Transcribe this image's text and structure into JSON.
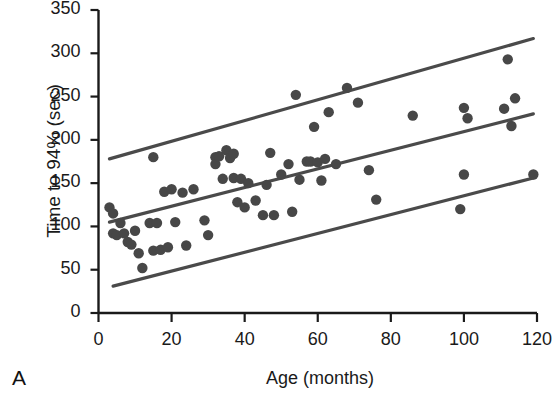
{
  "chart_data": {
    "type": "scatter",
    "title": "",
    "panel_label": "A",
    "xlabel": "Age (months)",
    "ylabel": "Time to 94% (sec)",
    "xlim": [
      0,
      120
    ],
    "ylim": [
      0,
      350
    ],
    "xticks": [
      0,
      20,
      40,
      60,
      80,
      100,
      120
    ],
    "yticks": [
      0,
      50,
      100,
      150,
      200,
      250,
      300,
      350
    ],
    "grid": false,
    "legend": "none",
    "marker_color": "#474747",
    "line_color": "#4a4a4a",
    "axis_color": "#1a1a1a",
    "points": [
      [
        3,
        122
      ],
      [
        4,
        115
      ],
      [
        4,
        92
      ],
      [
        5,
        90
      ],
      [
        6,
        104
      ],
      [
        7,
        92
      ],
      [
        8,
        82
      ],
      [
        9,
        79
      ],
      [
        10,
        95
      ],
      [
        11,
        69
      ],
      [
        12,
        52
      ],
      [
        14,
        104
      ],
      [
        15,
        180
      ],
      [
        15,
        72
      ],
      [
        16,
        104
      ],
      [
        17,
        73
      ],
      [
        18,
        140
      ],
      [
        19,
        76
      ],
      [
        20,
        143
      ],
      [
        21,
        105
      ],
      [
        23,
        139
      ],
      [
        24,
        78
      ],
      [
        26,
        143
      ],
      [
        29,
        107
      ],
      [
        30,
        90
      ],
      [
        32,
        180
      ],
      [
        32,
        172
      ],
      [
        33,
        181
      ],
      [
        34,
        155
      ],
      [
        35,
        188
      ],
      [
        36,
        179
      ],
      [
        37,
        184
      ],
      [
        37,
        156
      ],
      [
        38,
        128
      ],
      [
        39,
        155
      ],
      [
        40,
        122
      ],
      [
        41,
        150
      ],
      [
        43,
        130
      ],
      [
        45,
        113
      ],
      [
        46,
        148
      ],
      [
        47,
        185
      ],
      [
        48,
        113
      ],
      [
        50,
        160
      ],
      [
        52,
        172
      ],
      [
        53,
        117
      ],
      [
        54,
        252
      ],
      [
        55,
        154
      ],
      [
        57,
        175
      ],
      [
        58,
        175
      ],
      [
        59,
        215
      ],
      [
        60,
        174
      ],
      [
        61,
        153
      ],
      [
        62,
        178
      ],
      [
        63,
        232
      ],
      [
        65,
        172
      ],
      [
        68,
        260
      ],
      [
        71,
        243
      ],
      [
        74,
        165
      ],
      [
        76,
        131
      ],
      [
        86,
        228
      ],
      [
        99,
        120
      ],
      [
        100,
        160
      ],
      [
        100,
        237
      ],
      [
        101,
        225
      ],
      [
        111,
        236
      ],
      [
        112,
        293
      ],
      [
        113,
        216
      ],
      [
        114,
        248
      ],
      [
        119,
        160
      ]
    ],
    "reference_lines": [
      {
        "name": "upper-limit-line",
        "x": [
          3,
          119
        ],
        "y": [
          178,
          317
        ]
      },
      {
        "name": "mean-regression-line",
        "x": [
          3,
          119
        ],
        "y": [
          105,
          230
        ]
      },
      {
        "name": "lower-limit-line",
        "x": [
          4,
          119
        ],
        "y": [
          31,
          156
        ]
      }
    ]
  }
}
